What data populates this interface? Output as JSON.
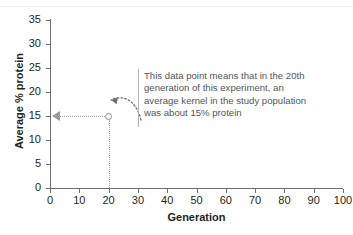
{
  "chart_data": {
    "type": "scatter",
    "title": "",
    "xlabel": "Generation",
    "ylabel": "Average % protein",
    "xlim": [
      0,
      100
    ],
    "ylim": [
      0,
      35
    ],
    "xticks": [
      "0",
      "10",
      "20",
      "30",
      "40",
      "50",
      "60",
      "70",
      "80",
      "90",
      "100"
    ],
    "yticks": [
      "0",
      "5",
      "10",
      "15",
      "20",
      "25",
      "30",
      "35"
    ],
    "grid": false,
    "legend": null,
    "series": [
      {
        "name": "Average % protein",
        "marker": "open-circle",
        "color": "#8e8e92",
        "points": [
          {
            "x": 20,
            "y": 15
          }
        ]
      }
    ],
    "annotations": [
      {
        "kind": "callout-text",
        "lines": [
          "This data point means that in the 20th",
          "generation of this experiment, an",
          "average kernel in the study population",
          "was about 15% protein"
        ],
        "target": {
          "x": 20,
          "y": 15
        }
      },
      {
        "kind": "guide-line-horizontal",
        "from": {
          "x": 20,
          "y": 15
        },
        "to": {
          "x": 0,
          "y": 15
        },
        "style": "dotted",
        "arrowhead": "left"
      },
      {
        "kind": "guide-line-vertical",
        "from": {
          "x": 20,
          "y": 15
        },
        "to": {
          "x": 20,
          "y": 0
        },
        "style": "dotted",
        "arrowhead": "none"
      },
      {
        "kind": "curved-arrow",
        "style": "dotted",
        "points_to": {
          "x": 20,
          "y": 15
        }
      }
    ]
  },
  "axes": {
    "y_title": "Average % protein",
    "x_title": "Generation",
    "y_tick_labels": [
      "35",
      "30",
      "25",
      "20",
      "15",
      "10",
      "5",
      "0"
    ],
    "x_tick_labels": [
      "0",
      "10",
      "20",
      "30",
      "40",
      "50",
      "60",
      "70",
      "80",
      "90",
      "100"
    ]
  },
  "callout": {
    "line1": "This data point means that in the 20th",
    "line2": "generation of this experiment, an",
    "line3": "average kernel in the study population",
    "line4": "was about 15% protein"
  },
  "artifacts": {
    "bleed_top_left": "",
    "bleed_top_right": "",
    "bleed_bottom_left": "",
    "bleed_bottom_right": ""
  },
  "colors": {
    "axis": "#6e6e72",
    "marker": "#8e8e92",
    "guide": "#a9a9ad",
    "callout_text": "#55555a",
    "callout_rule": "#b6b6ba",
    "text": "#231f20"
  }
}
